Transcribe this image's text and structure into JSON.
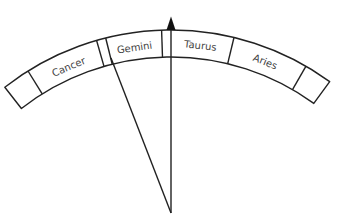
{
  "diagram": {
    "type": "zodiac dial with pointer",
    "signs": [
      {
        "label": "Cancer"
      },
      {
        "label": "Gemini"
      },
      {
        "label": "Taurus"
      },
      {
        "label": "Aries"
      }
    ],
    "pointer": "triangle-marker",
    "stroke_color": "#222222",
    "text_color": "#444444"
  }
}
